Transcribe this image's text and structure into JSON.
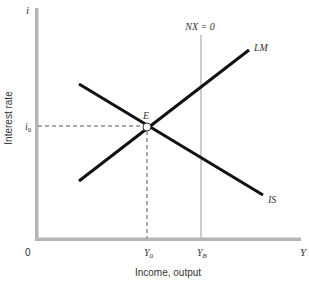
{
  "diagram": {
    "y_axis": {
      "symbol": "i",
      "label": "Interest rate",
      "tick_label": "i",
      "tick_subscript": "0"
    },
    "x_axis": {
      "symbol": "Y",
      "label": "Income, output",
      "origin": "0",
      "tick_y0": "Y",
      "tick_y0_sub": "0",
      "tick_yb": "Y",
      "tick_yb_sub": "B"
    },
    "curves": {
      "lm_label": "LM",
      "is_label": "IS",
      "nx_label": "NX = 0"
    },
    "equilibrium": {
      "label": "E"
    },
    "colors": {
      "axis": "#b5b5b5",
      "curve": "#111111",
      "nx_line": "#aaaaaa",
      "dashed": "#555555",
      "text": "#333333"
    }
  }
}
